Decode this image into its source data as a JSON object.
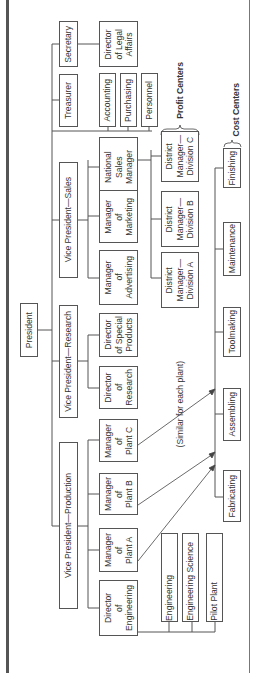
{
  "chart": {
    "orientation": "rotated-90-ccw",
    "root": {
      "label": "President"
    },
    "officers": [
      {
        "label": "Secretary"
      },
      {
        "label": "Treasurer"
      },
      {
        "label": "Vice President—Sales"
      },
      {
        "label": "Vice President—Research"
      },
      {
        "label": "Vice President—Production"
      }
    ],
    "secretary_reports": [
      {
        "label": "Director\nof Legal\nAffairs"
      }
    ],
    "treasurer_reports": [
      {
        "label": "Accounting"
      },
      {
        "label": "Purchasing"
      },
      {
        "label": "Personnel"
      }
    ],
    "sales_reports": [
      {
        "label": "National\nSales\nManager"
      },
      {
        "label": "Manager\nof\nMarketing"
      },
      {
        "label": "Manager\nof\nAdvertising"
      }
    ],
    "district_managers": [
      {
        "label": "District\nManager—\nDivision C"
      },
      {
        "label": "District\nManager—\nDivision B"
      },
      {
        "label": "District\nManager—\nDivision A"
      }
    ],
    "research_reports": [
      {
        "label": "Director\nof Special\nProducts"
      },
      {
        "label": "Director\nof\nResearch"
      }
    ],
    "production_reports": [
      {
        "label": "Manager\nof\nPlant C"
      },
      {
        "label": "Manager\nof\nPlant B"
      },
      {
        "label": "Manager\nof\nPlant A"
      },
      {
        "label": "Director\nof\nEngineering"
      }
    ],
    "engineering_reports": [
      {
        "label": "Engineering"
      },
      {
        "label": "Engineering Science"
      },
      {
        "label": "Pilot Plant"
      }
    ],
    "cost_centers": [
      {
        "label": "Finishing"
      },
      {
        "label": "Maintenance"
      },
      {
        "label": "Toolmaking"
      },
      {
        "label": "Assembling"
      },
      {
        "label": "Fabricating"
      }
    ],
    "annotations": {
      "profit_centers": "Profit Centers",
      "cost_centers": "Cost Centers",
      "similar_note": "(Similar for each plant)"
    }
  }
}
